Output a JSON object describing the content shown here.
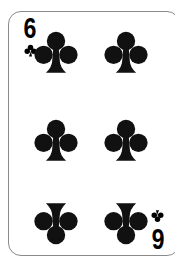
{
  "card": {
    "name": "Six of Clubs",
    "rank": "6",
    "rank_inverted_appearance": "9",
    "suit": "clubs",
    "suit_symbol": "♣",
    "suit_color": "#000000",
    "card_face_color": "#ffffff",
    "card_border_color": "#8a8a8a",
    "background_color": "#ffffff",
    "pip_count": 6,
    "pip_layout": {
      "columns": 2,
      "rows": 3,
      "bottom_row_rotated": true
    },
    "indices": [
      {
        "position": "top-left",
        "rank": "6",
        "suit_symbol": "♣",
        "rotated": false
      },
      {
        "position": "bottom-right",
        "rank": "6",
        "suit_symbol": "♣",
        "rotated": true
      }
    ],
    "pips": [
      {
        "row": "top",
        "column": "left",
        "rotated": false,
        "suit_symbol": "♣"
      },
      {
        "row": "top",
        "column": "right",
        "rotated": false,
        "suit_symbol": "♣"
      },
      {
        "row": "middle",
        "column": "left",
        "rotated": false,
        "suit_symbol": "♣"
      },
      {
        "row": "middle",
        "column": "right",
        "rotated": false,
        "suit_symbol": "♣"
      },
      {
        "row": "bottom",
        "column": "left",
        "rotated": true,
        "suit_symbol": "♣"
      },
      {
        "row": "bottom",
        "column": "right",
        "rotated": true,
        "suit_symbol": "♣"
      }
    ]
  }
}
